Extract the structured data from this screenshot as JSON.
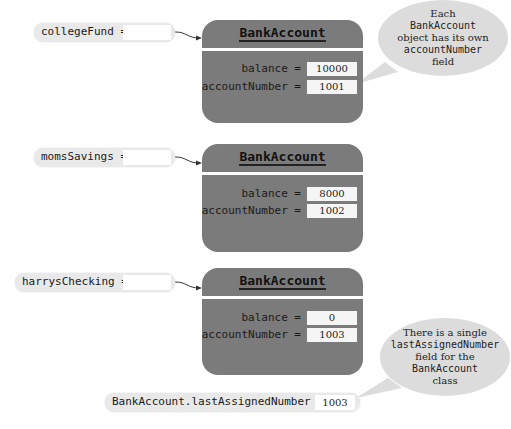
{
  "variables": [
    {
      "name": "collegeFund =",
      "top": 23,
      "left": 34,
      "width": 141
    },
    {
      "name": "momsSavings =",
      "top": 148,
      "left": 34,
      "width": 141
    },
    {
      "name": "harrysChecking =",
      "top": 273,
      "left": 15,
      "width": 160
    }
  ],
  "objects": [
    {
      "class_name": "BankAccount",
      "balance_label": "balance =",
      "balance": "10000",
      "account_label": "accountNumber =",
      "account_number": "1001"
    },
    {
      "class_name": "BankAccount",
      "balance_label": "balance =",
      "balance": "8000",
      "account_label": "accountNumber =",
      "account_number": "1002"
    },
    {
      "class_name": "BankAccount",
      "balance_label": "balance =",
      "balance": "0",
      "account_label": "accountNumber =",
      "account_number": "1003"
    }
  ],
  "static_field": {
    "label": "BankAccount.lastAssignedNumber =",
    "value": "1003"
  },
  "callouts": {
    "top": {
      "line1": "Each",
      "line2": "BankAccount",
      "line3": "object has its own",
      "line4": "accountNumber",
      "line5": "field"
    },
    "bottom": {
      "line1": "There is a single",
      "line2": "lastAssignedNumber",
      "line3": "field for the",
      "line4": "BankAccount",
      "line5": "class"
    }
  },
  "colors": {
    "object_fill": "#7b7b7b",
    "pill_fill": "#e9e9e9",
    "callout_fill": "#dcdcdc"
  }
}
